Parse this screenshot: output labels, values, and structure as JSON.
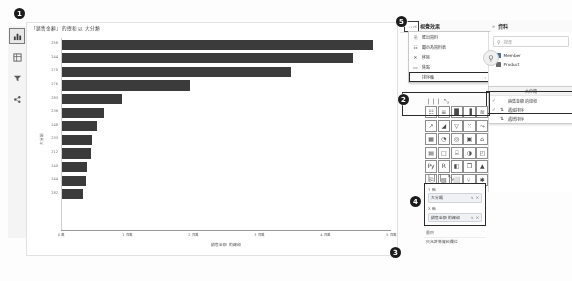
{
  "chart_data": {
    "type": "bar",
    "orientation": "horizontal",
    "title": "「銷售金額」的總和 以 大分類",
    "xlabel": "銷售金額 的總和",
    "ylabel": "大分類",
    "categories": [
      "258",
      "244",
      "275",
      "276",
      "283",
      "239",
      "248",
      "233",
      "212",
      "240",
      "244",
      "282"
    ],
    "values": [
      4.72,
      4.42,
      3.48,
      1.95,
      0.93,
      0.65,
      0.55,
      0.47,
      0.45,
      0.4,
      0.38,
      0.34
    ],
    "xticks": [
      "0 萬",
      "1 百萬",
      "2 百萬",
      "3 百萬",
      "4 百萬",
      "5 百萬"
    ],
    "xlim": [
      0,
      5
    ],
    "grid": false,
    "legend": "none",
    "bar_color": "#3b3b3b"
  },
  "rail": {
    "items": [
      {
        "name": "chart-view-icon",
        "glyph": "chart",
        "selected": true
      },
      {
        "name": "table-view-icon",
        "glyph": "table",
        "selected": false
      },
      {
        "name": "filter-view-icon",
        "glyph": "filter",
        "selected": false
      },
      {
        "name": "share-view-icon",
        "glyph": "share",
        "selected": false
      }
    ]
  },
  "panels": {
    "visual_header": {
      "label": "視覺效果",
      "chevron": "«"
    },
    "data_header": {
      "label": "資料",
      "chevron": "»"
    },
    "ellipsis_label": "⋯"
  },
  "context_menu": {
    "items": [
      {
        "label": "匯出資料",
        "icon": "⎘"
      },
      {
        "label": "顯示為資料表",
        "icon": "☷"
      },
      {
        "label": "移除",
        "icon": "✕"
      },
      {
        "label": "焦點",
        "icon": "▭"
      },
      {
        "label": "排序軸",
        "icon": "",
        "submenu": true,
        "highlighted": true
      }
    ]
  },
  "data_pane": {
    "search_placeholder": "搜尋",
    "tree": [
      {
        "label": "Member",
        "twisty": "›"
      },
      {
        "label": "Product",
        "twisty": "›"
      }
    ]
  },
  "sort_menu": {
    "category": "大分類",
    "items": [
      {
        "label": "銷售金額 的總和",
        "check": "✓",
        "icon": "",
        "selected": true
      },
      {
        "label": "遞減排序",
        "check": "✓",
        "icon": "⇅",
        "selected": true
      },
      {
        "label": "遞增排序",
        "check": "",
        "icon": "⇅",
        "selected": false
      }
    ]
  },
  "icon_grid": {
    "icons": [
      "stacked-bar-icon",
      "clustered-bar-icon",
      "stacked-column-icon",
      "clustered-column-icon",
      "ribbon-icon",
      "line-chart-icon",
      "area-chart-icon",
      "funnel-icon",
      "scatter-icon",
      "waterfall-icon",
      "matrix-icon",
      "pie-chart-icon",
      "donut-icon",
      "treemap-icon",
      "map-icon",
      "table-icon",
      "card-icon",
      "multirow-card-icon",
      "gauge-icon",
      "kpi-icon",
      "python-icon",
      "r-script-icon",
      "slicer-icon",
      "text-box-icon",
      "shape-icon",
      "page-icon",
      "image-icon",
      "button-icon",
      "decomposition-tree-icon",
      "key-influencers-icon"
    ],
    "glyphs": [
      "☷",
      "≡",
      "█",
      "▐",
      "≋",
      "↗",
      "◢",
      "▽",
      "⁙",
      "⤳",
      "▦",
      "◔",
      "◎",
      "▣",
      "⌂",
      "▤",
      "□",
      "⌸",
      "◑",
      "◰",
      "Py",
      "R",
      "◧",
      "❐",
      "▲",
      "⎘",
      "▧",
      "⬜",
      "⑂",
      "✱"
    ],
    "toolbar_glyphs": [
      "❘❘❘",
      "⤡"
    ]
  },
  "field_wells": {
    "y_axis": {
      "label": "Y 軸",
      "value": "大分類"
    },
    "x_axis": {
      "label": "X 軸",
      "value": "銷售金額 的總和"
    },
    "legend": {
      "label": "圖例",
      "value": "只允許將資料欄位"
    },
    "pill_actions": [
      "∨",
      "✕"
    ]
  },
  "markers": [
    {
      "id": "1",
      "text": "1"
    },
    {
      "id": "2",
      "text": "2"
    },
    {
      "id": "3",
      "text": "3"
    },
    {
      "id": "4",
      "text": "4"
    },
    {
      "id": "5",
      "text": "5"
    }
  ]
}
